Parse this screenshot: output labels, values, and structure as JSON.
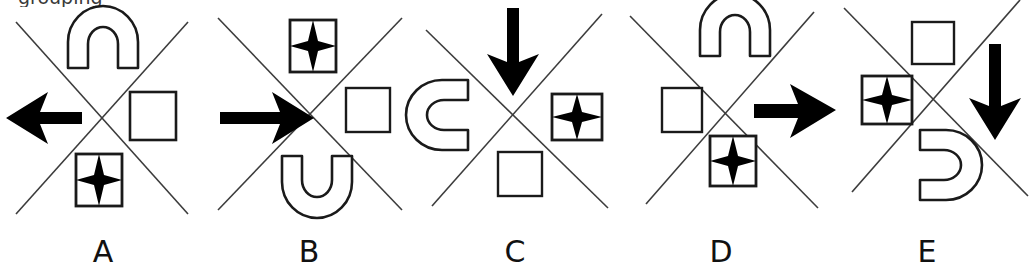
{
  "figure": {
    "type": "visual-analogy-answer-options",
    "background_color": "#ffffff",
    "ink_color": "#000000",
    "line_color": "#3c3c3c",
    "partial_cut_text": "grouping",
    "option_count": 5
  },
  "panels": [
    {
      "label": "A",
      "cross": "x-cross",
      "slots": {
        "top": "arch-up",
        "left": "arrow-left",
        "right": "square-empty",
        "bottom": "star-in-square"
      }
    },
    {
      "label": "B",
      "cross": "x-cross",
      "slots": {
        "top": "star-in-square",
        "left": "arrow-right",
        "right": "square-empty",
        "bottom": "arch-down"
      }
    },
    {
      "label": "C",
      "cross": "x-cross",
      "slots": {
        "top": "arrow-down",
        "left": "arch-right",
        "right": "star-in-square",
        "bottom": "square-empty"
      }
    },
    {
      "label": "D",
      "cross": "x-cross",
      "slots": {
        "top": "arch-up",
        "left": "square-empty",
        "right": "arrow-right",
        "bottom": "star-in-square"
      }
    },
    {
      "label": "E",
      "cross": "x-cross",
      "slots": {
        "top": "square-empty",
        "left": "star-in-square",
        "right": "arrow-down",
        "bottom": "arch-left"
      }
    }
  ]
}
